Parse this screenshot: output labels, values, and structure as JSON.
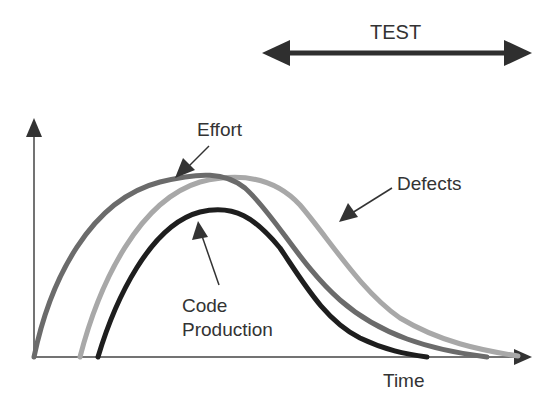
{
  "diagram": {
    "test_label": "TEST",
    "x_axis_label": "Time",
    "curves": [
      {
        "name": "Effort",
        "label": "Effort",
        "color": "#6b6b6b"
      },
      {
        "name": "Defects",
        "label": "Defects",
        "color": "#a8a8a8"
      },
      {
        "name": "Code Production",
        "label_line1": "Code",
        "label_line2": "Production",
        "color": "#1e1e1e"
      }
    ],
    "axis_color": "#333333"
  }
}
